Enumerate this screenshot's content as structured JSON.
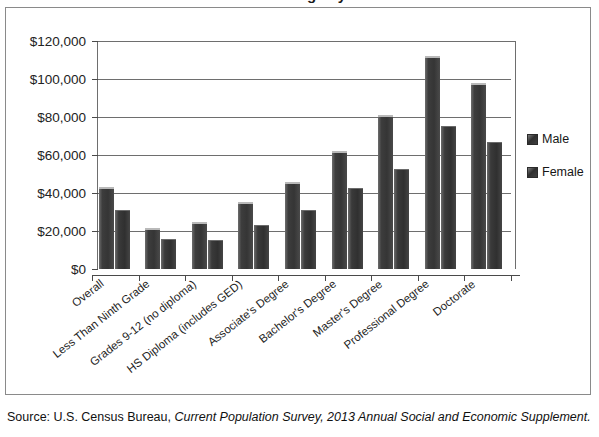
{
  "figure": {
    "cropped_title": "Median Annual Earnings by Educational Attainment",
    "source_prefix": "Source: U.S. Census Bureau, ",
    "source_italic": "Current Population Survey, 2013 Annual Social and Economic Supplement."
  },
  "legend": {
    "position": "right",
    "entries": [
      {
        "label": "Male",
        "color": "#383838"
      },
      {
        "label": "Female",
        "color": "#333333"
      }
    ]
  },
  "chart_data": {
    "type": "bar",
    "title": "",
    "xlabel": "",
    "ylabel": "",
    "ylim": [
      0,
      120000
    ],
    "yticks": [
      0,
      20000,
      40000,
      60000,
      80000,
      100000,
      120000
    ],
    "ytick_labels": [
      "$0",
      "$20,000",
      "$40,000",
      "$60,000",
      "$80,000",
      "$100,000",
      "$120,000"
    ],
    "grid": true,
    "categories": [
      "Overall",
      "Less Than Ninth Grade",
      "Grades 9-12 (no diploma)",
      "HS Diploma (includes GED)",
      "Associate's Degree",
      "Bachelor's Degree",
      "Master's Degree",
      "Professional Degree",
      "Doctorate"
    ],
    "series": [
      {
        "name": "Male",
        "color": "#383838",
        "values": [
          43000,
          21700,
          25000,
          35500,
          46000,
          62000,
          81000,
          112000,
          98000
        ]
      },
      {
        "name": "Female",
        "color": "#333333",
        "values": [
          30800,
          15900,
          15400,
          23000,
          31000,
          42500,
          52500,
          75500,
          67000
        ]
      }
    ]
  }
}
